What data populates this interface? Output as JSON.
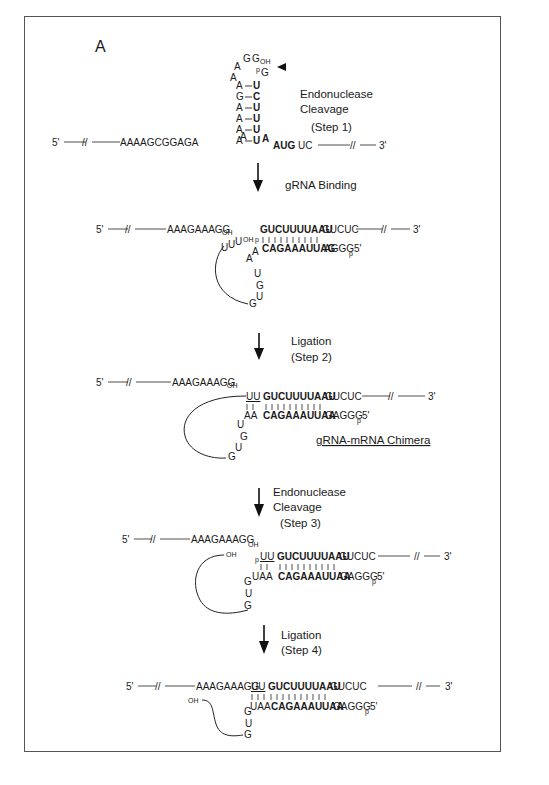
{
  "panel_label": "A",
  "common": {
    "five_prime": "5'",
    "three_prime": "3'",
    "oh": "OH",
    "p": "p",
    "break": "//"
  },
  "stage1": {
    "left_strand": "AAAAGCGGAGA",
    "loop_top": [
      "A",
      "G",
      "G"
    ],
    "loop_left_extra": "A",
    "cleavage_nt": "G",
    "stem_left": [
      "A",
      "G",
      "A",
      "A",
      "A",
      "A"
    ],
    "stem_right": [
      "U",
      "C",
      "U",
      "U",
      "U",
      "U"
    ],
    "junction_left": "A",
    "junction_right": "A",
    "right_strand_bold": "AUG",
    "right_strand": "UC",
    "label": [
      "Endonuclease",
      "Cleavage",
      "(Step 1)"
    ]
  },
  "step_gRNA_binding": "gRNA Binding",
  "stage2": {
    "mrna_5_fragment": "AAAGAAAGG",
    "guide_tail_top": "UUU",
    "mrna_bold": "GUCUUUUAAU",
    "mrna_tail": "GUCUC",
    "grna_bold": "CAGAAAUUAG",
    "grna_tail": "AGGG",
    "loop": [
      "A",
      "A",
      "U",
      "G",
      "U",
      "G"
    ]
  },
  "step2_label": [
    "Ligation",
    "(Step 2)"
  ],
  "stage3": {
    "mrna_5_fragment": "AAAGAAAGG",
    "inserted": "UU",
    "mrna_bold": "GUCUUUUAAU",
    "mrna_tail": "GUCUC",
    "grna_pre": "AA",
    "grna_bold": "CAGAAAUUAA",
    "grna_tail": "GAGGG",
    "loop": [
      "U",
      "G",
      "U",
      "G"
    ],
    "chimera_label": "gRNA-mRNA Chimera"
  },
  "step3_label": [
    "Endonuclease",
    "Cleavage",
    "(Step 3)"
  ],
  "stage4": {
    "mrna_5_fragment": "AAAGAAAGG",
    "inserted": "UU",
    "mrna_bold": "GUCUUUUAAU",
    "mrna_tail": "GUCUC",
    "grna_pre": "UAA",
    "grna_bold": "CAGAAAUUAA",
    "grna_tail": "GAGGG",
    "loop": [
      "G",
      "U",
      "G"
    ]
  },
  "step4_label": [
    "Ligation",
    "(Step 4)"
  ],
  "stage5": {
    "mrna_5_fragment": "AAAGAAAGG",
    "inserted": "UU",
    "mrna_bold": "GUCUUUUAAU",
    "mrna_tail": "GUCUC",
    "grna_pre": "UAA",
    "grna_bold": "CAGAAAUUAA",
    "grna_tail": "GAGGG",
    "loop": [
      "G",
      "U",
      "G"
    ]
  }
}
